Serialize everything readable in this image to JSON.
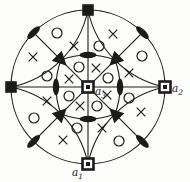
{
  "figure": {
    "background": "#fdfdfb",
    "ink": "#1b1b1b",
    "center": {
      "x": 88,
      "y": 87
    },
    "outer_circle": {
      "cx": 88,
      "cy": 87,
      "r": 77
    },
    "axis_lines": [
      {
        "x1": 88,
        "y1": 10,
        "x2": 88,
        "y2": 164
      },
      {
        "x1": 11,
        "y1": 87,
        "x2": 165,
        "y2": 87
      }
    ],
    "diagonal_lines": [
      {
        "x1": 33.6,
        "y1": 32.6,
        "x2": 142.4,
        "y2": 141.4
      },
      {
        "x1": 142.4,
        "y1": 32.6,
        "x2": 33.6,
        "y2": 141.4
      }
    ],
    "petal_arcs": [
      "M 88 10 A 99 99 0 0 1 11 87",
      "M 88 10 A 99 99 0 0 0 165 87",
      "M 88 164 A 99 99 0 0 0 11 87",
      "M 88 164 A 99 99 0 0 1 165 87"
    ],
    "inner_curve": "M 61 60 Q 74 55 88 55 Q 102 55 115 60 Q 120 73 120 87 Q 120 101 115 114 Q 102 119 88 119 Q 74 119 61 114 Q 56 101 56 87 Q 56 73 61 60 Z",
    "filled_squares": [
      {
        "x": 88,
        "y": 10
      },
      {
        "x": 11,
        "y": 87
      }
    ],
    "open_squares": [
      {
        "x": 165,
        "y": 87
      },
      {
        "x": 88,
        "y": 164
      },
      {
        "x": 88,
        "y": 87
      }
    ],
    "lenses": [
      {
        "x": 88,
        "y": 55,
        "angle": 0
      },
      {
        "x": 88,
        "y": 119,
        "angle": 0
      },
      {
        "x": 56,
        "y": 87,
        "angle": 90
      },
      {
        "x": 120,
        "y": 87,
        "angle": 90
      },
      {
        "x": 33.6,
        "y": 32.6,
        "angle": -45
      },
      {
        "x": 142.4,
        "y": 32.6,
        "angle": 45
      },
      {
        "x": 33.6,
        "y": 141.4,
        "angle": -45
      },
      {
        "x": 142.4,
        "y": 141.4,
        "angle": 45
      }
    ],
    "triangles": [
      {
        "x": 61,
        "y": 60,
        "angle": 45
      },
      {
        "x": 115,
        "y": 60,
        "angle": 135
      },
      {
        "x": 115,
        "y": 114,
        "angle": 225
      },
      {
        "x": 61,
        "y": 114,
        "angle": 315
      }
    ],
    "circle_marks": [
      {
        "x": 79,
        "y": 67
      },
      {
        "x": 108,
        "y": 78
      },
      {
        "x": 97,
        "y": 106
      },
      {
        "x": 69,
        "y": 96
      },
      {
        "x": 57,
        "y": 33
      },
      {
        "x": 142,
        "y": 56
      },
      {
        "x": 119,
        "y": 141
      },
      {
        "x": 34,
        "y": 118
      },
      {
        "x": 47,
        "y": 76
      },
      {
        "x": 99,
        "y": 46
      },
      {
        "x": 129,
        "y": 98
      },
      {
        "x": 77,
        "y": 128
      }
    ],
    "cross_marks": [
      {
        "x": 96,
        "y": 68
      },
      {
        "x": 107,
        "y": 95
      },
      {
        "x": 80,
        "y": 106
      },
      {
        "x": 69,
        "y": 79
      },
      {
        "x": 74,
        "y": 46
      },
      {
        "x": 129,
        "y": 73
      },
      {
        "x": 102,
        "y": 128
      },
      {
        "x": 47,
        "y": 101
      },
      {
        "x": 33,
        "y": 57
      },
      {
        "x": 113,
        "y": 34
      },
      {
        "x": 141,
        "y": 112
      },
      {
        "x": 63,
        "y": 140
      }
    ],
    "labels": [
      {
        "id": "a1",
        "text": "a",
        "sub": "1",
        "x": 72,
        "y": 176
      },
      {
        "id": "a2",
        "text": "a",
        "sub": "2",
        "x": 172,
        "y": 92
      },
      {
        "id": "a3",
        "text": "a",
        "sub": "3",
        "x": 95,
        "y": 95
      }
    ]
  }
}
